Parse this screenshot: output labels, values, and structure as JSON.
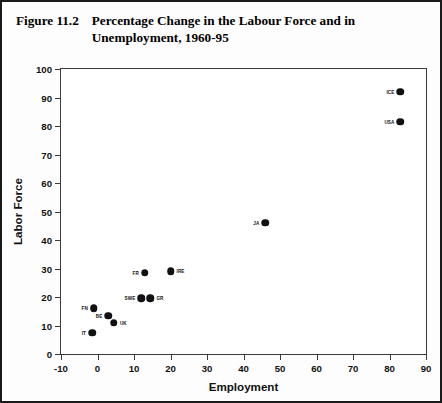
{
  "figure": {
    "caption_number": "Figure 11.2",
    "caption_text": "Percentage Change in the Labour Force and in Unemployment, 1960-95"
  },
  "chart_data": {
    "type": "scatter",
    "title": "Percentage Change in the Labour Force and in Unemployment, 1960-95",
    "xlabel": "Employment",
    "ylabel": "Labor Force",
    "xlim": [
      -10,
      90
    ],
    "ylim": [
      0,
      100
    ],
    "xticks": [
      "-10",
      "0",
      "10",
      "20",
      "30",
      "40",
      "50",
      "60",
      "70",
      "80",
      "90"
    ],
    "yticks": [
      "0",
      "10",
      "20",
      "30",
      "40",
      "50",
      "60",
      "70",
      "80",
      "90",
      "100"
    ],
    "grid": false,
    "legend": "none",
    "marker_color": "#111111",
    "points": [
      {
        "label": "IT",
        "x": -1.5,
        "y": 7.5,
        "label_side": "left"
      },
      {
        "label": "FN",
        "x": -1.0,
        "y": 16.0,
        "label_side": "left"
      },
      {
        "label": "UK",
        "x": 4.5,
        "y": 11.0,
        "label_side": "right"
      },
      {
        "label": "BE",
        "x": 3.0,
        "y": 13.5,
        "label_side": "left"
      },
      {
        "label": "SWE",
        "x": 12.0,
        "y": 19.5,
        "label_side": "left"
      },
      {
        "label": "GR",
        "x": 14.5,
        "y": 19.5,
        "label_side": "right"
      },
      {
        "label": "FR",
        "x": 13.0,
        "y": 28.5,
        "label_side": "left"
      },
      {
        "label": "IRE",
        "x": 20.0,
        "y": 29.0,
        "label_side": "right"
      },
      {
        "label": "JA",
        "x": 46.0,
        "y": 46.0,
        "label_side": "left"
      },
      {
        "label": "USA",
        "x": 83.0,
        "y": 81.5,
        "label_side": "left"
      },
      {
        "label": "ICE",
        "x": 83.0,
        "y": 92.0,
        "label_side": "left"
      }
    ]
  }
}
